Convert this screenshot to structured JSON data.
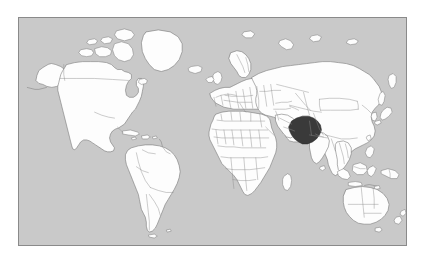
{
  "figure": {
    "type": "world-locator-map",
    "projection": "equirectangular",
    "frame": {
      "border_color": "#8a8a8a",
      "border_width_px": 1
    },
    "colors": {
      "ocean": "#c9c9c9",
      "land_fill": "#fdfdfd",
      "coastline": "#6e6e6e",
      "internal_border": "#8d8d8d",
      "highlight_fill": "#3a3a3a",
      "highlight_stroke": "#2b2b2b",
      "page_background": "#ffffff"
    },
    "highlighted": {
      "name": "Iran",
      "region": "Western Asia / Middle East",
      "fill": "#3a3a3a"
    },
    "legend": {
      "visible": false,
      "entries": []
    },
    "labels": {
      "title": "",
      "caption": "",
      "visible_text": []
    },
    "graticule": {
      "visible": false
    },
    "continents": [
      "North America",
      "South America",
      "Europe",
      "Africa",
      "Asia",
      "Oceania"
    ],
    "notable_landmasses": [
      "Greenland",
      "Iceland",
      "Great Britain",
      "Ireland",
      "Madagascar",
      "Sri Lanka",
      "Japan",
      "Philippines",
      "Indonesia",
      "Papua New Guinea",
      "Australia",
      "New Zealand",
      "Cuba",
      "Hispaniola",
      "Tasmania",
      "Svalbard",
      "Novaya Zemlya",
      "Sakhalin",
      "Taiwan",
      "Borneo",
      "Sumatra",
      "Java",
      "Sulawesi",
      "Canadian Arctic Archipelago"
    ]
  }
}
